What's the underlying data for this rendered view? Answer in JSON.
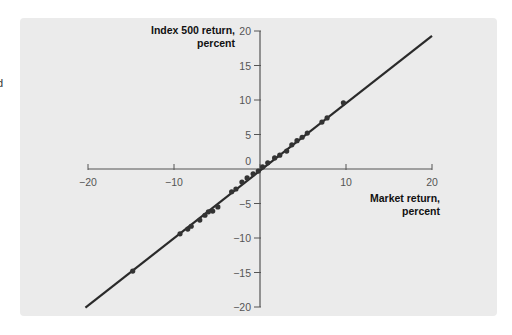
{
  "page": {
    "edge_fragment": "d"
  },
  "chart_data": {
    "type": "scatter",
    "title": "",
    "xlabel": "Market return, percent",
    "ylabel": "Index 500 return, percent",
    "xlabel_lines": [
      "Market return,",
      "percent"
    ],
    "ylabel_lines": [
      "Index 500 return,",
      "percent"
    ],
    "xlim": [
      -20,
      20
    ],
    "ylim": [
      -20,
      20
    ],
    "xticks": [
      -20,
      -10,
      0,
      10,
      20
    ],
    "yticks": [
      20,
      15,
      10,
      5,
      0,
      -5,
      -10,
      -15,
      -20
    ],
    "grid": false,
    "legend": null,
    "fit_line": {
      "x": [
        -20.3,
        20.0
      ],
      "y": [
        -20.1,
        19.3
      ],
      "color": "#2a2a2a"
    },
    "points": {
      "x": [
        -14.8,
        -9.3,
        -8.4,
        -8.0,
        -7.0,
        -6.4,
        -6.0,
        -5.5,
        -4.9,
        -3.3,
        -2.8,
        -2.1,
        -1.5,
        -0.8,
        -0.2,
        0.3,
        0.9,
        1.7,
        2.3,
        3.1,
        3.7,
        4.3,
        4.9,
        5.5,
        7.2,
        7.8,
        9.7
      ],
      "y": [
        -14.8,
        -9.4,
        -8.7,
        -8.3,
        -7.4,
        -6.7,
        -6.2,
        -6.1,
        -5.5,
        -3.3,
        -2.9,
        -1.9,
        -1.3,
        -0.7,
        -0.3,
        0.3,
        0.9,
        1.6,
        2.0,
        2.6,
        3.5,
        4.1,
        4.6,
        5.2,
        6.8,
        7.4,
        9.6
      ],
      "color": "#333333"
    },
    "colors": {
      "panel_bg": "#ebebeb",
      "axis": "#555555",
      "line": "#2a2a2a"
    }
  }
}
